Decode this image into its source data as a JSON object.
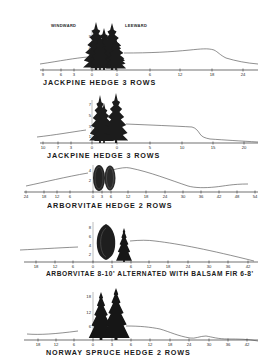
{
  "figure": {
    "direction_labels": {
      "windward": "WINDWARD",
      "leeward": "LEEWARD"
    },
    "panels": [
      {
        "id": "jackpine-1",
        "caption": "JACKPINE HEDGE 3 ROWS",
        "x_ticks": [
          "9",
          "6",
          "3",
          "0",
          "0",
          "6",
          "12",
          "18",
          "24"
        ],
        "y_ticks": [
          "9",
          "6"
        ],
        "tree_type": "jackpine"
      },
      {
        "id": "jackpine-2",
        "caption": "JACKPINE HEDGE 3 ROWS",
        "x_ticks": [
          "10",
          "7",
          "3",
          "0",
          "0",
          "5",
          "10",
          "15",
          "20"
        ],
        "y_ticks": [
          "7",
          "5",
          "3",
          "1"
        ],
        "tree_type": "jackpine"
      },
      {
        "id": "arborvitae",
        "caption": "ARBORVITAE HEDGE 2 ROWS",
        "x_ticks": [
          "24",
          "18",
          "12",
          "6",
          "0",
          "3",
          "6",
          "12",
          "18",
          "24",
          "30",
          "36",
          "42",
          "48",
          "54"
        ],
        "y_ticks": [
          "4",
          "2"
        ],
        "tree_type": "arborvitae"
      },
      {
        "id": "arborvitae-balsam",
        "caption": "ARBORVITAE 8-10' ALTERNATED WITH BALSAM FIR 6-8'",
        "x_ticks": [
          "18",
          "12",
          "6",
          "0",
          "3",
          "6",
          "12",
          "18",
          "24",
          "30",
          "36",
          "42"
        ],
        "y_ticks": [
          "8",
          "6",
          "4",
          "2"
        ],
        "tree_type": "arborvitae+balsam"
      },
      {
        "id": "norway-spruce",
        "caption": "NORWAY SPRUCE HEDGE 2 ROWS",
        "x_ticks": [
          "18",
          "12",
          "6",
          "0",
          "3",
          "6",
          "12",
          "18",
          "24",
          "30",
          "36",
          "42"
        ],
        "y_ticks": [
          "18",
          "12",
          "6"
        ],
        "tree_type": "norway-spruce"
      }
    ]
  }
}
